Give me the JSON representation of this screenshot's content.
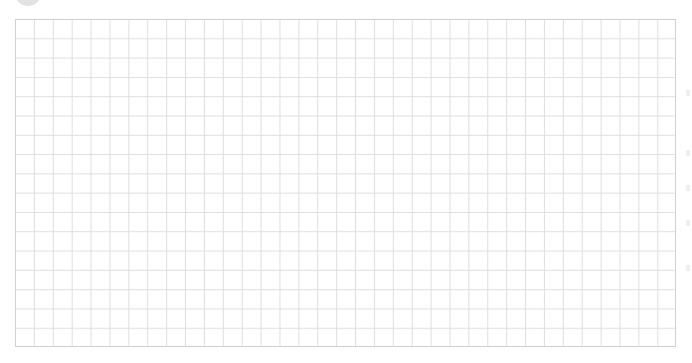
{
  "canvas": {
    "background": "#ffffff"
  },
  "grid": {
    "columns": 35,
    "rows": 17,
    "line_color": "#dedede",
    "border_color": "#d0d0d0"
  },
  "avatar": {
    "color": "#e2e2e2",
    "icon": "avatar-icon"
  }
}
